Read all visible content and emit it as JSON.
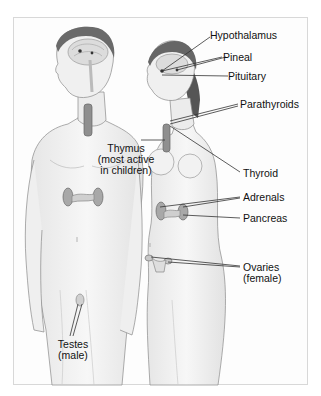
{
  "diagram": {
    "type": "anatomical illustration",
    "figures": [
      "male",
      "female"
    ],
    "labels": [
      {
        "id": "hypothalamus",
        "line1": "Hypothalamus"
      },
      {
        "id": "pineal",
        "line1": "Pineal"
      },
      {
        "id": "pituitary",
        "line1": "Pituitary"
      },
      {
        "id": "parathyroids",
        "line1": "Parathyroids"
      },
      {
        "id": "thymus",
        "line1": "Thymus",
        "line2": "(most active",
        "line3": "in children)"
      },
      {
        "id": "thyroid",
        "line1": "Thyroid"
      },
      {
        "id": "adrenals",
        "line1": "Adrenals"
      },
      {
        "id": "pancreas",
        "line1": "Pancreas"
      },
      {
        "id": "ovaries",
        "line1": "Ovaries",
        "line2": "(female)"
      },
      {
        "id": "testes",
        "line1": "Testes",
        "line2": "(male)"
      }
    ]
  }
}
